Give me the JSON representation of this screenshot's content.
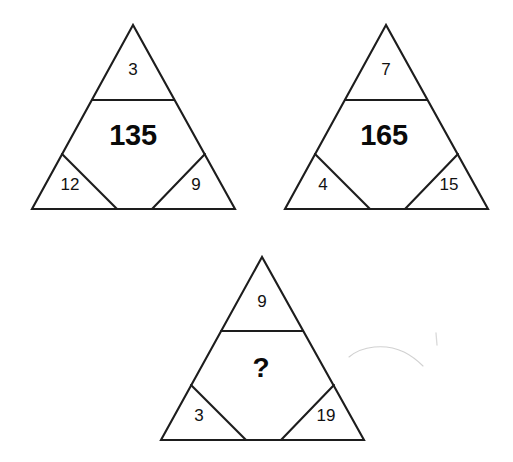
{
  "page": {
    "background_color": "#ffffff",
    "line_color": "#1d1d1d",
    "text_color": "#111111"
  },
  "puzzle": {
    "type": "triangle-number-analogy",
    "shape_count": 3,
    "unknown_marker": "?",
    "triangles": [
      {
        "id": "triangle-1",
        "position": "top-left",
        "top": "3",
        "center": "135",
        "bottom_left": "12",
        "bottom_right": "9",
        "geometry": {
          "apex_x": 133,
          "apex_y": 25,
          "base_left_x": 32,
          "base_right_x": 235,
          "base_y": 209,
          "divider_y": 100,
          "inner_apex_y": 154,
          "inner_base_left_x": 117,
          "inner_base_right_x": 152
        }
      },
      {
        "id": "triangle-2",
        "position": "top-right",
        "top": "7",
        "center": "165",
        "bottom_left": "4",
        "bottom_right": "15",
        "geometry": {
          "apex_x": 386,
          "apex_y": 25,
          "base_left_x": 285,
          "base_right_x": 488,
          "base_y": 209,
          "divider_y": 100,
          "inner_apex_y": 154,
          "inner_base_left_x": 370,
          "inner_base_right_x": 405
        }
      },
      {
        "id": "triangle-3",
        "position": "bottom-center",
        "top": "9",
        "center": "?",
        "bottom_left": "3",
        "bottom_right": "19",
        "geometry": {
          "apex_x": 262,
          "apex_y": 257,
          "base_left_x": 161,
          "base_right_x": 364,
          "base_y": 440,
          "divider_y": 331,
          "inner_apex_y": 385,
          "inner_base_left_x": 246,
          "inner_base_right_x": 281
        }
      }
    ]
  },
  "artifacts": {
    "smudge_label": "scan-smudge",
    "tick_label": "scan-tick"
  }
}
